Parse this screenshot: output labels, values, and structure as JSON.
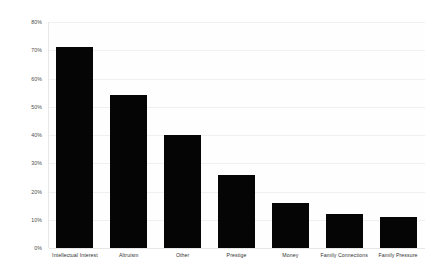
{
  "chart_data": {
    "type": "bar",
    "title": "",
    "subtitle": "",
    "xlabel": "",
    "ylabel": "",
    "categories": [
      "Intellectual Interest",
      "Altruism",
      "Other",
      "Prestige",
      "Money",
      "Family Connections",
      "Family Pressure"
    ],
    "values": [
      71,
      54,
      40,
      26,
      16,
      12,
      11
    ],
    "value_unit": "%",
    "ylim": [
      0,
      80
    ],
    "ytick_labels": [
      "0%",
      "10%",
      "20%",
      "30%",
      "40%",
      "50%",
      "60%",
      "70%",
      "80%"
    ],
    "ytick_values": [
      0,
      10,
      20,
      30,
      40,
      50,
      60,
      70,
      80
    ],
    "grid": true,
    "grid_axis": "y",
    "legend": false,
    "legend_position": "none",
    "series": [
      {
        "name": "",
        "values": [
          71,
          54,
          40,
          26,
          16,
          12,
          11
        ],
        "color": "#050505"
      }
    ],
    "colors": {
      "bar": "#050505",
      "gridline": "#f0f0f0",
      "axis": "#e6e6e6",
      "plot_background": "#fefefe",
      "figure_background": "#ffffff",
      "tick_label": "#4a4a4a",
      "category_label": "#333333"
    }
  }
}
